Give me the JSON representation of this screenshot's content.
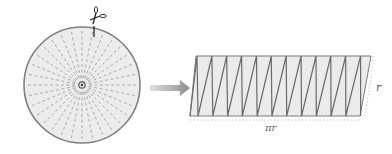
{
  "diagram": {
    "circle": {
      "cx": 82,
      "cy": 85,
      "r": 58,
      "sectors": 32,
      "fill": "#ececec",
      "stroke": "#808080",
      "dash_color": "#9a9a9a"
    },
    "scissors_icon": "scissors",
    "arrow": {
      "from_x": 150,
      "to_x": 190,
      "y": 88,
      "color": "#8c8c8c"
    },
    "parallelogram": {
      "top_left_x": 196,
      "top_y": 56,
      "bottom_left_x": 190,
      "bottom_y": 116,
      "top_right_x": 371,
      "bottom_right_x": 360,
      "pieces_up": 12,
      "fill": "#ebebeb",
      "stroke": "#7a7a7a"
    },
    "labels": {
      "height": "r",
      "width": "πr"
    }
  }
}
